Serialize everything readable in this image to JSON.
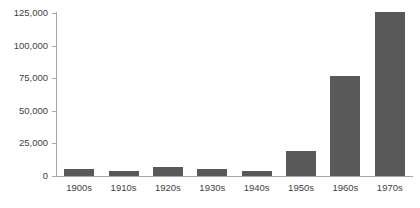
{
  "chart_data": {
    "type": "bar",
    "title": "",
    "subtitle": "",
    "xlabel": "",
    "ylabel": "",
    "categories": [
      "1900s",
      "1910s",
      "1920s",
      "1930s",
      "1940s",
      "1950s",
      "1960s",
      "1970s"
    ],
    "values": [
      5500,
      4200,
      6800,
      5200,
      3500,
      19200,
      77000,
      126000
    ],
    "ylim": [
      0,
      125000
    ],
    "yticks": [
      0,
      25000,
      50000,
      75000,
      100000,
      125000
    ],
    "ytick_labels": [
      "0",
      "25,000",
      "50,000",
      "75,000",
      "100,000",
      "125,000"
    ],
    "grid": false,
    "legend": null,
    "bar_color": "#595959",
    "axis_color": "#a6a6a6",
    "background": "#ffffff"
  }
}
